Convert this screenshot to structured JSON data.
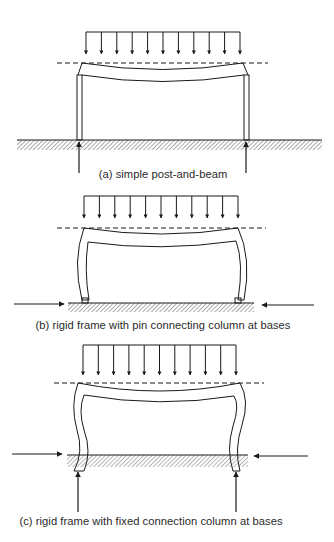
{
  "figure": {
    "panels": [
      {
        "id": "a",
        "caption": "(a) simple post-and-beam",
        "load": "uniformly distributed load (11 downward arrows)",
        "supports": "simple posts bearing on ground",
        "reactions": [
          "vertical upward at left base",
          "vertical upward at right base"
        ]
      },
      {
        "id": "b",
        "caption": "(b) rigid frame with pin connecting column at bases",
        "load": "uniformly distributed load (11 downward arrows)",
        "supports": "pinned bases",
        "reactions": [
          "horizontal inward at left",
          "horizontal inward at right"
        ]
      },
      {
        "id": "c",
        "caption": "(c) rigid frame with fixed connection column at bases",
        "load": "uniformly distributed load (11 downward arrows)",
        "supports": "fixed bases embedded in ground",
        "reactions": [
          "horizontal inward at left",
          "horizontal inward at right",
          "vertical upward at left base",
          "vertical upward at right base"
        ]
      }
    ],
    "colors": {
      "line": "#1a1a1a",
      "hatch": "#555555",
      "background": "#ffffff"
    }
  }
}
